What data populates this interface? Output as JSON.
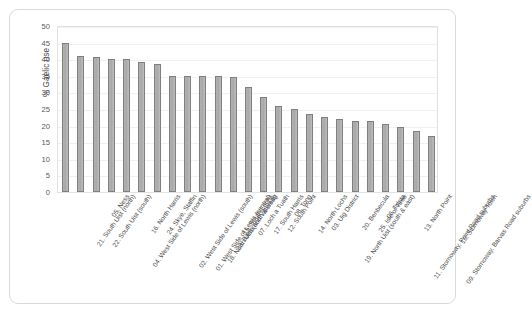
{
  "chart_data": {
    "type": "bar",
    "title": "",
    "xlabel": "",
    "ylabel": "% Gaelic use",
    "ylim": [
      0,
      50
    ],
    "ytick_step": 5,
    "yticks": [
      "50",
      "45",
      "40",
      "35",
      "30",
      "25",
      "20",
      "15",
      "10",
      "5",
      "0"
    ],
    "grid": true,
    "legend": "none",
    "bar_color": "#aeaeae",
    "bar_border_color": "#7f7f7f",
    "categories": [
      "21. South Uist (north)",
      "22. South Uist (south)",
      "05. Ness",
      "04. West Side of Lewis (north)",
      "16. North Harris",
      "24. Skye, Staffin",
      "02. West Side of Lewis (south)",
      "01. West Side of Lewis (central)",
      "18. North Uist (north & west)",
      "23. Barra and Vatersay",
      "15. South Lochs",
      "07. Loch a Tuath",
      "17. South Harris",
      "12. South Point",
      "08. Tong",
      "14. North Lochs",
      "03. Uig District",
      "19. North Uist (south & east)",
      "20. Benbecula",
      "25. Isle of Tiree",
      "06. Tolsta",
      "11. Stornoway, Point Road suburbs",
      "13. North Point",
      "09. Stornoway, Barvas Road suburbs",
      "10. Stornoway Town"
    ],
    "values": [
      45,
      41,
      40.7,
      40,
      40,
      39.3,
      38.5,
      35,
      35,
      35,
      34.8,
      34.7,
      31.5,
      28.5,
      26,
      25,
      23.5,
      22.5,
      22,
      21.5,
      21.3,
      20.5,
      19.7,
      18.5,
      17
    ]
  },
  "chart": {
    "y_axis_title": "% Gaelic use"
  }
}
